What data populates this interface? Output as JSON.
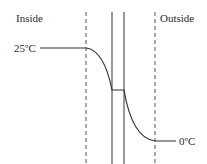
{
  "diagram": {
    "type": "temperature-profile-through-wall",
    "labels": {
      "inside": "Inside",
      "outside": "Outside",
      "inside_temp": "25ºC",
      "outside_temp": "0ºC"
    },
    "colors": {
      "line": "#333333",
      "dashed": "#555555",
      "background": "#ffffff"
    }
  }
}
